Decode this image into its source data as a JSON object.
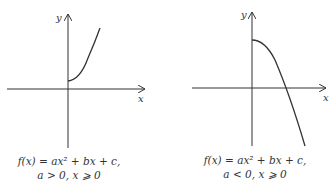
{
  "panels": [
    {
      "id": "left",
      "axis_x_label": "x",
      "axis_y_label": "y",
      "caption_line1": "f(x) = ax² + bx + c,",
      "caption_line2": "a > 0,  x ⩾ 0",
      "curve": "increasing concave-up from positive y-intercept"
    },
    {
      "id": "right",
      "axis_x_label": "x",
      "axis_y_label": "y",
      "caption_line1": "f(x) = ax² + bx + c,",
      "caption_line2": "a < 0,  x ⩾ 0",
      "curve": "decreasing concave-down from positive y-intercept, crossing x-axis"
    }
  ],
  "colors": {
    "line": "#333333",
    "background": "#ffffff"
  }
}
